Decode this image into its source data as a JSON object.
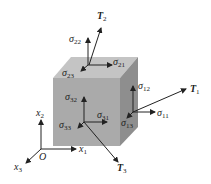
{
  "figure": {
    "colors": {
      "cube_front": "#aaaaaa",
      "cube_top": "#c4c4c4",
      "cube_side": "#8e8e8e",
      "arrow": "#222222"
    }
  },
  "labels": {
    "T2": {
      "base": "T",
      "sub": "2"
    },
    "T1": {
      "base": "T",
      "sub": "1"
    },
    "T3": {
      "base": "T",
      "sub": "3"
    },
    "s22": {
      "base": "σ",
      "sub": "22"
    },
    "s21": {
      "base": "σ",
      "sub": "21"
    },
    "s23": {
      "base": "σ",
      "sub": "23"
    },
    "s12": {
      "base": "σ",
      "sub": "12"
    },
    "s11": {
      "base": "σ",
      "sub": "11"
    },
    "s13": {
      "base": "σ",
      "sub": "13"
    },
    "s32": {
      "base": "σ",
      "sub": "32"
    },
    "s31": {
      "base": "σ",
      "sub": "31"
    },
    "s33": {
      "base": "σ",
      "sub": "33"
    },
    "x1": {
      "base": "x",
      "sub": "1"
    },
    "x2": {
      "base": "x",
      "sub": "2"
    },
    "x3": {
      "base": "x",
      "sub": "3"
    },
    "origin": "O"
  }
}
